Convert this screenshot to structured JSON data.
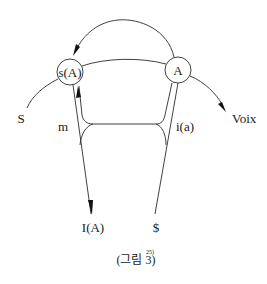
{
  "diagram": {
    "nodes": {
      "sA": {
        "label": "s(A)"
      },
      "A": {
        "label": "A"
      }
    },
    "labels": {
      "S": "S",
      "Voix": "Voix",
      "m": "m",
      "ia": "i(a)",
      "IA": "I(A)",
      "barred_S": "$"
    },
    "caption": {
      "text": "(그림 3)",
      "footnote": "25)"
    }
  }
}
